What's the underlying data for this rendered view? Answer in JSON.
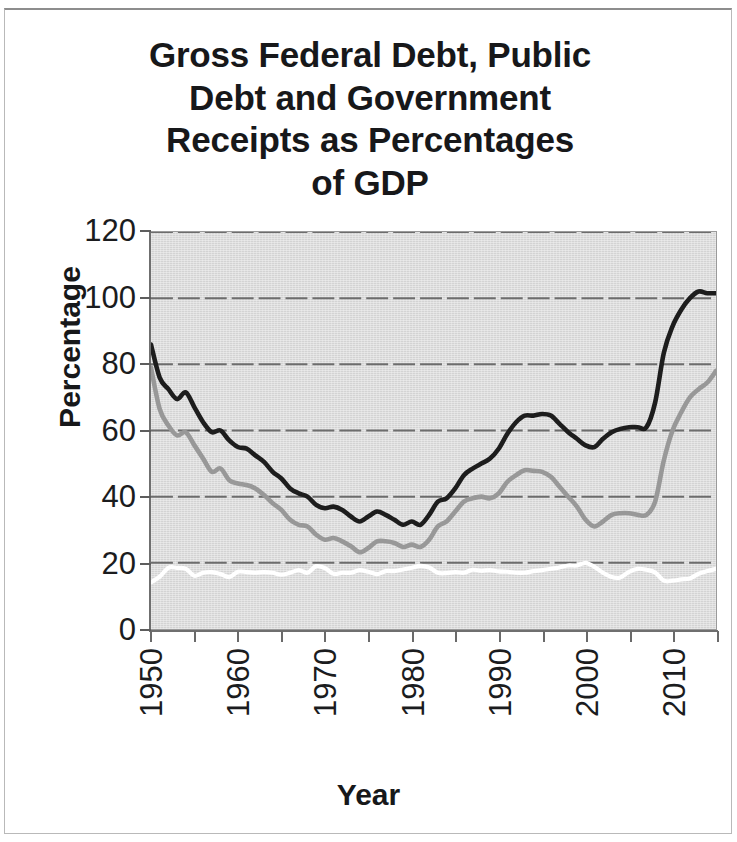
{
  "figure": {
    "title": "Gross Federal Debt, Public\nDebt and Government\nReceipts as  Percentages\nof GDP",
    "x_axis_title": "Year",
    "y_axis_title": "Percentage"
  },
  "colors": {
    "plot_background": "#dcdcdc",
    "page_background": "#ffffff",
    "gridline": "#6d6d6d",
    "axis": "#6f6f6f",
    "gross_federal_debt": "#1d1d1d",
    "public_debt": "#989898",
    "government_receipts": "#ffffff",
    "text": "#17181a"
  },
  "chart_data": {
    "type": "line",
    "title": "Gross Federal Debt, Public Debt and Government Receipts as  Percentages of GDP",
    "xlabel": "Year",
    "ylabel": "Percentage",
    "xlim": [
      1950,
      2015
    ],
    "ylim": [
      0,
      120
    ],
    "yticks": [
      0,
      20,
      40,
      60,
      80,
      100,
      120
    ],
    "ytick_labels": [
      "0",
      "20",
      "40",
      "60",
      "80",
      "100",
      "120"
    ],
    "xtick_labels": [
      "1950",
      "1960",
      "1970",
      "1980",
      "1990",
      "2000",
      "2010"
    ],
    "xticks_major": [
      1950,
      1960,
      1970,
      1980,
      1990,
      2000,
      2010
    ],
    "xticks_minor_step": 5,
    "grid": "horizontal",
    "legend": "none",
    "x": [
      1950,
      1951,
      1952,
      1953,
      1954,
      1955,
      1956,
      1957,
      1958,
      1959,
      1960,
      1961,
      1962,
      1963,
      1964,
      1965,
      1966,
      1967,
      1968,
      1969,
      1970,
      1971,
      1972,
      1973,
      1974,
      1975,
      1976,
      1977,
      1978,
      1979,
      1980,
      1981,
      1982,
      1983,
      1984,
      1985,
      1986,
      1987,
      1988,
      1989,
      1990,
      1991,
      1992,
      1993,
      1994,
      1995,
      1996,
      1997,
      1998,
      1999,
      2000,
      2001,
      2002,
      2003,
      2004,
      2005,
      2006,
      2007,
      2008,
      2009,
      2010,
      2011,
      2012,
      2013,
      2014,
      2015
    ],
    "series": [
      {
        "name": "Gross Federal Debt",
        "color": "#1d1d1d",
        "values": [
          86.0,
          76.0,
          72.5,
          69.5,
          71.5,
          67.0,
          62.5,
          59.5,
          60.0,
          57.0,
          55.0,
          54.5,
          52.5,
          50.5,
          47.5,
          45.5,
          42.5,
          41.0,
          40.0,
          37.5,
          36.5,
          37.0,
          36.0,
          34.0,
          32.5,
          34.0,
          35.5,
          34.5,
          33.0,
          31.5,
          32.5,
          31.5,
          34.5,
          38.5,
          39.5,
          42.5,
          46.5,
          48.5,
          50.0,
          51.5,
          54.5,
          59.0,
          62.5,
          64.5,
          64.5,
          65.0,
          64.5,
          62.0,
          59.5,
          57.5,
          55.5,
          55.0,
          57.5,
          59.5,
          60.5,
          61.0,
          61.0,
          61.0,
          68.5,
          83.5,
          91.5,
          96.5,
          100.0,
          102.0,
          101.5,
          101.5
        ]
      },
      {
        "name": "Public Debt",
        "color": "#989898",
        "values": [
          79.0,
          66.5,
          61.5,
          58.5,
          59.5,
          55.5,
          51.5,
          47.5,
          48.5,
          45.0,
          44.0,
          43.5,
          42.5,
          40.5,
          38.0,
          36.0,
          33.0,
          31.5,
          31.0,
          28.5,
          27.0,
          27.5,
          26.5,
          25.0,
          23.2,
          24.5,
          26.5,
          26.5,
          26.0,
          24.8,
          25.5,
          24.8,
          27.0,
          31.0,
          32.5,
          35.5,
          38.5,
          39.5,
          40.0,
          39.5,
          41.0,
          44.5,
          46.5,
          48.0,
          47.8,
          47.5,
          46.0,
          43.0,
          40.0,
          37.0,
          33.0,
          31.0,
          32.5,
          34.5,
          35.0,
          35.0,
          34.5,
          34.5,
          38.5,
          51.0,
          60.0,
          65.5,
          70.0,
          72.5,
          74.5,
          78.0
        ]
      },
      {
        "name": "Government Receipts",
        "color": "#ffffff",
        "values": [
          14.1,
          15.8,
          18.5,
          18.5,
          18.2,
          16.1,
          17.0,
          17.2,
          16.6,
          15.7,
          17.3,
          17.2,
          17.0,
          17.2,
          17.0,
          16.4,
          17.0,
          17.8,
          17.0,
          19.0,
          18.4,
          16.7,
          17.0,
          17.0,
          17.8,
          17.3,
          16.6,
          17.5,
          17.5,
          18.0,
          18.5,
          19.1,
          18.6,
          17.0,
          16.9,
          17.2,
          17.0,
          17.9,
          17.6,
          17.8,
          17.4,
          17.3,
          17.0,
          17.0,
          17.5,
          17.8,
          18.2,
          18.6,
          19.2,
          19.2,
          20.0,
          18.8,
          17.0,
          15.7,
          15.6,
          17.3,
          18.2,
          17.9,
          17.1,
          14.6,
          14.6,
          15.0,
          15.3,
          16.7,
          17.5,
          18.2
        ]
      }
    ]
  }
}
